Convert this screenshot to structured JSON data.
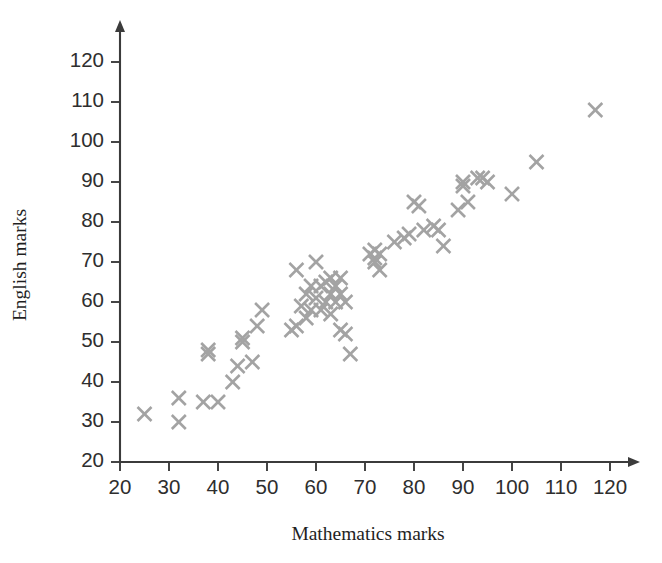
{
  "chart_data": {
    "type": "scatter",
    "title": "",
    "xlabel": "Mathematics marks",
    "ylabel": "English marks",
    "xlim": [
      20,
      120
    ],
    "ylim": [
      20,
      125
    ],
    "xticks": [
      20,
      30,
      40,
      50,
      60,
      70,
      80,
      90,
      100,
      110,
      120
    ],
    "yticks": [
      20,
      30,
      40,
      50,
      60,
      70,
      80,
      90,
      100,
      110,
      120
    ],
    "xtick_labels": [
      "20",
      "30",
      "40",
      "50",
      "60",
      "70",
      "80",
      "90",
      "100",
      "110",
      "120"
    ],
    "ytick_labels": [
      "20",
      "30",
      "40",
      "50",
      "60",
      "70",
      "80",
      "90",
      "100",
      "110",
      "120"
    ],
    "grid": false,
    "legend": null,
    "marker": "x",
    "marker_color": "#a3a3a3",
    "marker_size": 14,
    "axis_color": "#3b3b3b",
    "background": "#ffffff",
    "n_points": 64,
    "x": [
      25,
      32,
      32,
      37,
      38,
      38,
      40,
      43,
      44,
      45,
      45,
      47,
      48,
      49,
      55,
      56,
      56,
      57,
      58,
      58,
      59,
      59,
      60,
      60,
      61,
      61,
      62,
      62,
      63,
      63,
      63,
      64,
      64,
      65,
      65,
      65,
      66,
      66,
      67,
      71,
      72,
      72,
      72,
      73,
      73,
      76,
      78,
      79,
      80,
      81,
      82,
      84,
      85,
      86,
      89,
      90,
      90,
      91,
      93,
      94,
      95,
      100,
      105,
      117
    ],
    "y": [
      32,
      36,
      30,
      35,
      48,
      47,
      35,
      40,
      44,
      50,
      51,
      45,
      54,
      58,
      53,
      68,
      54,
      59,
      62,
      56,
      64,
      58,
      70,
      61,
      64,
      58,
      65,
      60,
      66,
      62,
      57,
      64,
      60,
      66,
      62,
      53,
      60,
      52,
      47,
      72,
      73,
      71,
      70,
      72,
      68,
      75,
      76,
      77,
      85,
      84,
      78,
      79,
      78,
      74,
      83,
      90,
      89,
      85,
      91,
      91,
      90,
      87,
      95,
      108
    ],
    "points": [
      {
        "x": 25,
        "y": 32
      },
      {
        "x": 32,
        "y": 36
      },
      {
        "x": 32,
        "y": 30
      },
      {
        "x": 37,
        "y": 35
      },
      {
        "x": 38,
        "y": 48
      },
      {
        "x": 38,
        "y": 47
      },
      {
        "x": 40,
        "y": 35
      },
      {
        "x": 43,
        "y": 40
      },
      {
        "x": 44,
        "y": 44
      },
      {
        "x": 45,
        "y": 50
      },
      {
        "x": 45,
        "y": 51
      },
      {
        "x": 47,
        "y": 45
      },
      {
        "x": 48,
        "y": 54
      },
      {
        "x": 49,
        "y": 58
      },
      {
        "x": 55,
        "y": 53
      },
      {
        "x": 56,
        "y": 68
      },
      {
        "x": 56,
        "y": 54
      },
      {
        "x": 57,
        "y": 59
      },
      {
        "x": 58,
        "y": 62
      },
      {
        "x": 58,
        "y": 56
      },
      {
        "x": 59,
        "y": 64
      },
      {
        "x": 59,
        "y": 58
      },
      {
        "x": 60,
        "y": 70
      },
      {
        "x": 60,
        "y": 61
      },
      {
        "x": 61,
        "y": 64
      },
      {
        "x": 61,
        "y": 58
      },
      {
        "x": 62,
        "y": 65
      },
      {
        "x": 62,
        "y": 60
      },
      {
        "x": 63,
        "y": 66
      },
      {
        "x": 63,
        "y": 62
      },
      {
        "x": 63,
        "y": 57
      },
      {
        "x": 64,
        "y": 64
      },
      {
        "x": 64,
        "y": 60
      },
      {
        "x": 65,
        "y": 66
      },
      {
        "x": 65,
        "y": 62
      },
      {
        "x": 65,
        "y": 53
      },
      {
        "x": 66,
        "y": 60
      },
      {
        "x": 66,
        "y": 52
      },
      {
        "x": 67,
        "y": 47
      },
      {
        "x": 71,
        "y": 72
      },
      {
        "x": 72,
        "y": 73
      },
      {
        "x": 72,
        "y": 71
      },
      {
        "x": 72,
        "y": 70
      },
      {
        "x": 73,
        "y": 72
      },
      {
        "x": 73,
        "y": 68
      },
      {
        "x": 76,
        "y": 75
      },
      {
        "x": 78,
        "y": 76
      },
      {
        "x": 79,
        "y": 77
      },
      {
        "x": 80,
        "y": 85
      },
      {
        "x": 81,
        "y": 84
      },
      {
        "x": 82,
        "y": 78
      },
      {
        "x": 84,
        "y": 79
      },
      {
        "x": 85,
        "y": 78
      },
      {
        "x": 86,
        "y": 74
      },
      {
        "x": 89,
        "y": 83
      },
      {
        "x": 90,
        "y": 90
      },
      {
        "x": 90,
        "y": 89
      },
      {
        "x": 91,
        "y": 85
      },
      {
        "x": 93,
        "y": 91
      },
      {
        "x": 94,
        "y": 91
      },
      {
        "x": 95,
        "y": 90
      },
      {
        "x": 100,
        "y": 87
      },
      {
        "x": 105,
        "y": 95
      },
      {
        "x": 117,
        "y": 108
      }
    ]
  }
}
